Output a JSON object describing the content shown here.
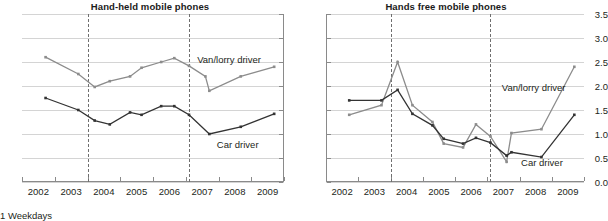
{
  "footnote": "1 Weekdays",
  "axis": {
    "ylabels": [
      "0.0",
      "0.5",
      "1.0",
      "1.5",
      "2.0",
      "2.5",
      "3.0",
      "3.5"
    ],
    "xlabels": [
      "2002",
      "2003",
      "2004",
      "2005",
      "2006",
      "2007",
      "2008",
      "2009"
    ]
  },
  "colors": {
    "van_lorry": "#8c8c8c",
    "car": "#333333",
    "grid": "#d4d4d4",
    "axis": "#8a8a8a",
    "divider": "#6f6f6f",
    "text": "#231f20"
  },
  "chart_data": [
    {
      "type": "line",
      "title": "Hand-held mobile phones",
      "xlabel": "",
      "ylabel": "",
      "ylim": [
        0.0,
        3.5
      ],
      "xlim": [
        2002.0,
        2010.0
      ],
      "yticks": [
        0.0,
        0.5,
        1.0,
        1.5,
        2.0,
        2.5,
        3.0,
        3.5
      ],
      "xticks": [
        2002,
        2003,
        2004,
        2005,
        2006,
        2007,
        2008,
        2009,
        2010
      ],
      "grid": true,
      "legend": "inline-labels",
      "annotations": [
        {
          "text": "Van/lorry driver",
          "x": 2007.35,
          "y": 2.55
        },
        {
          "text": "Car driver",
          "x": 2007.95,
          "y": 0.78
        }
      ],
      "vertical_reference_lines": [
        2004.0,
        2007.1
      ],
      "series": [
        {
          "name": "Van/lorry driver",
          "color": "#8c8c8c",
          "x": [
            2002.72,
            2003.72,
            2004.22,
            2004.68,
            2005.3,
            2005.65,
            2006.25,
            2006.65,
            2007.1,
            2007.6,
            2007.72,
            2008.68,
            2009.7
          ],
          "values": [
            2.6,
            2.25,
            1.98,
            2.1,
            2.2,
            2.38,
            2.5,
            2.58,
            2.42,
            2.2,
            1.9,
            2.2,
            2.4
          ]
        },
        {
          "name": "Car driver",
          "color": "#333333",
          "x": [
            2002.72,
            2003.72,
            2004.22,
            2004.68,
            2005.3,
            2005.65,
            2006.25,
            2006.65,
            2007.1,
            2007.72,
            2008.68,
            2009.7
          ],
          "values": [
            1.75,
            1.5,
            1.28,
            1.2,
            1.45,
            1.4,
            1.58,
            1.58,
            1.4,
            1.0,
            1.15,
            1.42
          ]
        }
      ]
    },
    {
      "type": "line",
      "title": "Hands free mobile phones",
      "xlabel": "",
      "ylabel": "",
      "ylim": [
        0.0,
        3.5
      ],
      "xlim": [
        2002.0,
        2010.0
      ],
      "yticks": [
        0.0,
        0.5,
        1.0,
        1.5,
        2.0,
        2.5,
        3.0,
        3.5
      ],
      "xticks": [
        2002,
        2003,
        2004,
        2005,
        2006,
        2007,
        2008,
        2009,
        2010
      ],
      "grid": true,
      "legend": "inline-labels",
      "annotations": [
        {
          "text": "Van/lorry driver",
          "x": 2007.45,
          "y": 1.95
        },
        {
          "text": "Car driver",
          "x": 2008.05,
          "y": 0.4
        }
      ],
      "vertical_reference_lines": [
        2004.0,
        2007.1
      ],
      "series": [
        {
          "name": "Van/lorry driver",
          "color": "#8c8c8c",
          "x": [
            2002.72,
            2003.72,
            2004.22,
            2004.68,
            2005.3,
            2005.65,
            2006.25,
            2006.65,
            2007.1,
            2007.6,
            2007.75,
            2008.68,
            2009.7
          ],
          "values": [
            1.4,
            1.6,
            2.5,
            1.6,
            1.25,
            0.8,
            0.72,
            1.2,
            0.95,
            0.42,
            1.02,
            1.1,
            2.4
          ]
        },
        {
          "name": "Car driver",
          "color": "#333333",
          "x": [
            2002.72,
            2003.72,
            2004.22,
            2004.68,
            2005.3,
            2005.65,
            2006.25,
            2006.65,
            2007.1,
            2007.6,
            2007.75,
            2008.68,
            2009.7
          ],
          "values": [
            1.7,
            1.7,
            1.92,
            1.42,
            1.18,
            0.9,
            0.8,
            0.92,
            0.82,
            0.55,
            0.62,
            0.52,
            1.4
          ]
        }
      ]
    }
  ]
}
